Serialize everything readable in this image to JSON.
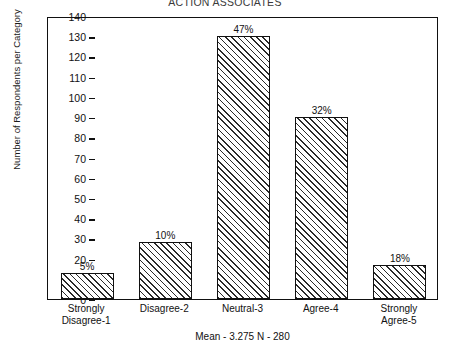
{
  "chart_data": {
    "type": "bar",
    "title": "ACTION ASSOCIATES",
    "xlabel": "",
    "ylabel": "Number of Respondents per Category",
    "footnote": "Mean - 3.275  N - 280",
    "categories": [
      "Strongly\nDisagree-1",
      "Disagree-2",
      "Neutral-3",
      "Agree-4",
      "Strongly\nAgree-5"
    ],
    "category_lines": [
      [
        "Strongly",
        "Disagree-1"
      ],
      [
        "Disagree-2"
      ],
      [
        "Neutral-3"
      ],
      [
        "Agree-4"
      ],
      [
        "Strongly",
        "Agree-5"
      ]
    ],
    "values": [
      13,
      28,
      130,
      90,
      17
    ],
    "data_labels": [
      "5%",
      "10%",
      "47%",
      "32%",
      "18%"
    ],
    "ylim": [
      0,
      140
    ],
    "ytick_step": 10,
    "yticks": [
      0,
      10,
      20,
      30,
      40,
      50,
      60,
      70,
      80,
      90,
      100,
      110,
      120,
      130,
      140
    ],
    "ytick_labels": [
      "0",
      "10",
      "20",
      "30",
      "40",
      "50",
      "60",
      "70",
      "80",
      "90",
      "100",
      "110",
      "120",
      "130",
      "140"
    ],
    "grid": false,
    "legend": null,
    "bar_fill": "diagonal-hatch",
    "bar_edge_color": "#111111",
    "mean": "3.275",
    "n": "280"
  }
}
